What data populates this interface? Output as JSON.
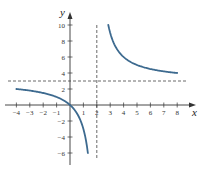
{
  "chart_data": {
    "type": "line",
    "title": "",
    "xlabel": "x",
    "ylabel": "y",
    "function": "y = 3x/(x - 2)",
    "xlim": [
      -4.5,
      9
    ],
    "ylim": [
      -7.5,
      11.5
    ],
    "x_ticks": [
      -4,
      -3,
      -2,
      -1,
      1,
      2,
      3,
      4,
      5,
      6,
      7,
      8
    ],
    "x_tick_labels": [
      "-4",
      "-3",
      "-2",
      "-1",
      "1",
      "2",
      "3",
      "4",
      "5",
      "6",
      "7",
      "8"
    ],
    "y_ticks": [
      10,
      8,
      6,
      4,
      2,
      -2,
      -4,
      -6
    ],
    "y_tick_labels": [
      "10",
      "8",
      "6",
      "4",
      "2",
      "-2",
      "-4",
      "-6"
    ],
    "grid": false,
    "asymptotes": [
      {
        "orientation": "vertical",
        "value": 2,
        "style": "dashed"
      },
      {
        "orientation": "horizontal",
        "value": 3,
        "style": "dashed"
      }
    ],
    "series": [
      {
        "name": "left branch",
        "x": [
          -4,
          -3,
          -2,
          -1,
          0,
          0.5,
          1,
          1.33
        ],
        "y": [
          2,
          1.8,
          1.5,
          1,
          0,
          -1,
          -3,
          -6
        ]
      },
      {
        "name": "right branch",
        "x": [
          2.86,
          3,
          4,
          5,
          6,
          7,
          8
        ],
        "y": [
          10,
          9,
          6,
          5,
          4.5,
          4.2,
          4
        ]
      }
    ],
    "colors": {
      "curve": "#3d6a8f",
      "axes": "#333333",
      "asymptote": "#444444"
    }
  }
}
